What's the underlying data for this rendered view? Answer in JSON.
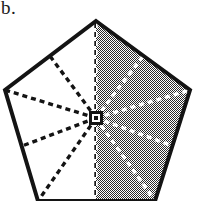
{
  "figure": {
    "panel_label": "b.",
    "caption": "",
    "background_color": "#ffffff",
    "ink_color": "#141414",
    "shade_color": "#9a9a9a",
    "shade_description": "50-percent halftone checkerboard dither"
  },
  "chart_data": {
    "type": "diagram",
    "title": "",
    "subtitle": "",
    "xlabel": "",
    "ylabel": "",
    "grid": false,
    "legend_position": "none",
    "coordinate_space": {
      "width": 200,
      "height": 201,
      "units": "pixels",
      "origin": "top-left"
    },
    "shapes": [
      {
        "name": "outer-pentagon",
        "kind": "regular-pentagon",
        "n_sides": 5,
        "stroke": "#141414",
        "stroke_width": 4,
        "fill": "none",
        "vertices": [
          {
            "label": "A",
            "role": "apex-top",
            "x": 96,
            "y": 21
          },
          {
            "label": "B",
            "role": "upper-right",
            "x": 190,
            "y": 90
          },
          {
            "label": "C",
            "role": "lower-right",
            "x": 155,
            "y": 201
          },
          {
            "label": "D",
            "role": "lower-left",
            "x": 38,
            "y": 201
          },
          {
            "label": "E",
            "role": "upper-left",
            "x": 5,
            "y": 90
          }
        ]
      },
      {
        "name": "center-marker",
        "kind": "square-with-hole",
        "x": 96,
        "y": 118,
        "outer_size": 11,
        "inner_size": 4,
        "stroke": "#141414",
        "fill": "none"
      }
    ],
    "edge_midpoints": [
      {
        "label": "M_AB",
        "on_edge": "A-B",
        "x": 143,
        "y": 56
      },
      {
        "label": "M_BC",
        "on_edge": "B-C",
        "x": 173,
        "y": 146
      },
      {
        "label": "M_CD",
        "on_edge": "C-D",
        "x": 96,
        "y": 201
      },
      {
        "label": "M_DE",
        "on_edge": "D-E",
        "x": 22,
        "y": 146
      },
      {
        "label": "M_EA",
        "on_edge": "E-A",
        "x": 50,
        "y": 56
      }
    ],
    "spokes": {
      "description": "Ten dashed spokes radiate from the pentagon center to the five vertices and the five edge midpoints, dividing the pentagon into 10 congruent triangular sectors.",
      "count": 10,
      "center": {
        "x": 96,
        "y": 118
      },
      "style": "dashed",
      "dash_pattern": "5 4",
      "stroke_width": 3.4,
      "stroke_on_white": "#141414",
      "stroke_on_shade": "#ffffff",
      "targets": [
        {
          "label": "A",
          "x": 96,
          "y": 21,
          "type": "vertex"
        },
        {
          "label": "M_AB",
          "x": 143,
          "y": 56,
          "type": "midpoint"
        },
        {
          "label": "B",
          "x": 190,
          "y": 90,
          "type": "vertex"
        },
        {
          "label": "M_BC",
          "x": 173,
          "y": 146,
          "type": "midpoint"
        },
        {
          "label": "C",
          "x": 155,
          "y": 201,
          "type": "vertex"
        },
        {
          "label": "M_CD",
          "x": 96,
          "y": 201,
          "type": "midpoint"
        },
        {
          "label": "D",
          "x": 38,
          "y": 201,
          "type": "vertex"
        },
        {
          "label": "M_DE",
          "x": 22,
          "y": 146,
          "type": "midpoint"
        },
        {
          "label": "E",
          "x": 5,
          "y": 90,
          "type": "vertex"
        },
        {
          "label": "M_EA",
          "x": 50,
          "y": 56,
          "type": "midpoint"
        }
      ]
    },
    "shaded_region": {
      "name": "right-half-shading",
      "description": "The half of the pentagon lying to the right of the vertical axis through the apex and the center is filled with a 50% halftone pattern; the left half is unfilled white.",
      "fill_pattern": "checkerboard-50",
      "fill_color": "#9a9a9a",
      "fraction_of_whole": 0.5,
      "sectors_shaded": 5,
      "sectors_total": 10,
      "polygon_points": [
        {
          "x": 96,
          "y": 21
        },
        {
          "x": 190,
          "y": 90
        },
        {
          "x": 155,
          "y": 201
        },
        {
          "x": 96,
          "y": 201
        }
      ]
    }
  }
}
